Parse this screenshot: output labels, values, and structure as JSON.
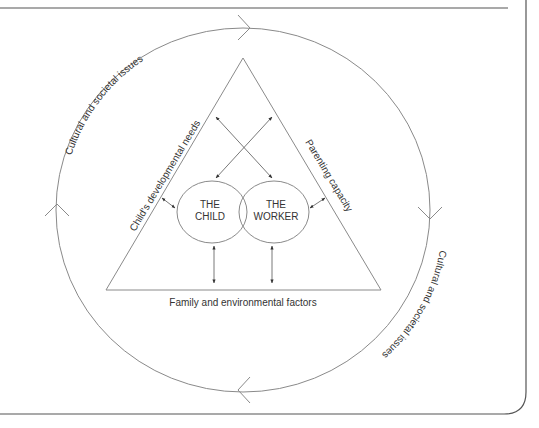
{
  "diagram": {
    "outer_ring_labels": {
      "top_left": "Cultural and societal issues",
      "bottom_right": "Cultural and societal issues"
    },
    "triangle_sides": {
      "left": "Child's developmental needs",
      "right": "Parenting capacity",
      "base": "Family and environmental factors"
    },
    "nodes": {
      "child": {
        "line1": "THE",
        "line2": "CHILD"
      },
      "worker": {
        "line1": "THE",
        "line2": "WORKER"
      }
    },
    "colors": {
      "stroke": "#8a8a8a",
      "text": "#333333",
      "frame": "#555555"
    }
  }
}
